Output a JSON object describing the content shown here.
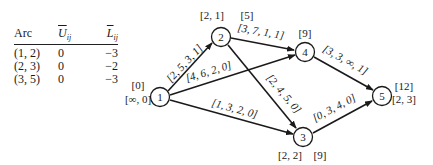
{
  "table": {
    "headers": [
      "Arc",
      "U_ij",
      "L_ij"
    ],
    "header_display": {
      "arc": "Arc",
      "u": "U",
      "u_sub": "ij",
      "l": "L",
      "l_sub": "ij"
    },
    "rows": [
      {
        "arc": "(1, 2)",
        "u": "0",
        "l": "−3"
      },
      {
        "arc": "(2, 3)",
        "u": "0",
        "l": "−2"
      },
      {
        "arc": "(3, 5)",
        "u": "0",
        "l": "−3"
      }
    ]
  },
  "graph": {
    "nodes": [
      {
        "id": "1",
        "label": "1",
        "top_label": "[0]",
        "bottom_label": "[∞, 0]"
      },
      {
        "id": "2",
        "label": "2",
        "top_label": "[2, 1]",
        "extra_label": "[5]"
      },
      {
        "id": "3",
        "label": "3",
        "bottom_label": "[2, 2]",
        "extra_label": "[9]"
      },
      {
        "id": "4",
        "label": "4",
        "top_label": "[9]"
      },
      {
        "id": "5",
        "label": "5",
        "top_label": "[12]",
        "bottom_label": "[2, 3]"
      }
    ],
    "arcs": [
      {
        "from": "1",
        "to": "2",
        "label": "[2, 5, 3, 1]"
      },
      {
        "from": "1",
        "to": "4",
        "label": "[4, 6, 2, 0]"
      },
      {
        "from": "1",
        "to": "3",
        "label": "[1, 3, 2, 0]"
      },
      {
        "from": "2",
        "to": "4",
        "label": "[3, 7, 1, 1]"
      },
      {
        "from": "2",
        "to": "3",
        "label": "[2, 4, 5, 0]"
      },
      {
        "from": "4",
        "to": "5",
        "label": "[3, 3, ∞, 1]"
      },
      {
        "from": "3",
        "to": "5",
        "label": "[0, 3, 4, 0]"
      }
    ]
  }
}
